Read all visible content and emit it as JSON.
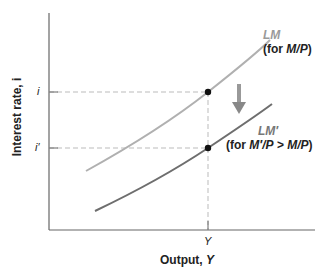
{
  "diagram": {
    "type": "LM curve shift",
    "axes": {
      "x_label_prefix": "Output, ",
      "x_label_var": "Y",
      "y_label": "Interest rate, i",
      "x_tick": "Y",
      "y_ticks": [
        "i",
        "i′"
      ]
    },
    "curves": [
      {
        "name": "LM",
        "label_top": "LM",
        "label_bottom": "(for M/P)",
        "color": "#b0b0b0"
      },
      {
        "name": "LM′",
        "label_top": "LM′",
        "label_bottom": "(for M′/P > M/P)",
        "color": "#6e6e6e"
      }
    ],
    "arrow": {
      "direction": "down",
      "color": "#888888"
    },
    "points": [
      {
        "x_label": "Y",
        "y_label": "i"
      },
      {
        "x_label": "Y",
        "y_label": "i′"
      }
    ]
  },
  "labels": {
    "lm_top": "LM",
    "lm_bottom_pre": "(for ",
    "lm_bottom_var": "M/P",
    "lm_bottom_post": ")",
    "lmp_top": "LM′",
    "lmp_bottom_pre": "(for ",
    "lmp_bottom_var1": "M′/P",
    "lmp_bottom_op": " > ",
    "lmp_bottom_var2": "M/P",
    "lmp_bottom_post": ")",
    "y_axis_label": "Interest rate, i",
    "x_axis_label_prefix": "Output, ",
    "x_axis_label_var": "Y",
    "x_tick": "Y",
    "y_tick_i": "i",
    "y_tick_ip": "i′"
  }
}
